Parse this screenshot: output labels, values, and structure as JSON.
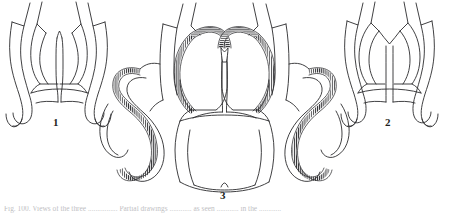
{
  "figure": {
    "domain": "scientific-line-drawing",
    "background_color": "#ffffff",
    "ink_color": "#2b2b2e",
    "width_px": 450,
    "height_px": 214,
    "panels": [
      {
        "id": "panel-1",
        "label": "1",
        "position": "left",
        "description": "Outline drawing of a bicuspid valve-like structure with two upward arrow-shaped cut tube ends, paired arched cusps, a central vertical septum and two downward hooked lower limbs. No hatching.",
        "has_hatched_band": false
      },
      {
        "id": "panel-3",
        "label": "3",
        "position": "center",
        "description": "Largest drawing: two central arched cusps meeting at a notched junction, flanked by two large outward-looping lobes, all traced by a dense ladder-like hatched band; cut tube ends above and hooked limbs below.",
        "has_hatched_band": true
      },
      {
        "id": "panel-2",
        "label": "2",
        "position": "right",
        "description": "Outline drawing similar to panel 1 but with fuller, rounder paired cusps, a V-shaped central notch, and downward hooked lower limbs. No hatching.",
        "has_hatched_band": false
      }
    ],
    "labels": {
      "one": "1",
      "two": "2",
      "three": "3"
    },
    "caption": {
      "visible": true,
      "legible": false,
      "note": "Caption line is clipped by the bottom edge of the image; only the faint tops of the letters are rendered and no words can be read.",
      "text": "Fig. 100.  Views of the three ................ Partial drawings ............ as seen ............ in the ............"
    }
  }
}
